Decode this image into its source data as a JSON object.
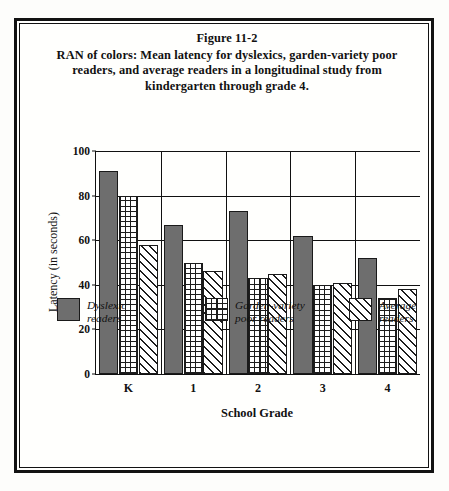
{
  "caption": {
    "figure_number": "Figure 11-2",
    "text": "RAN of colors: Mean latency for dyslexics, garden-variety poor readers, and average readers in a longitudinal study from kindergarten through grade 4."
  },
  "chart_data": {
    "type": "bar",
    "title": "RAN of colors: Mean latency for dyslexics, garden-variety poor readers, and average readers in a longitudinal study from kindergarten through grade 4.",
    "xlabel": "School Grade",
    "ylabel": "Latency (in seconds)",
    "categories": [
      "K",
      "1",
      "2",
      "3",
      "4"
    ],
    "ylim": [
      0,
      100
    ],
    "yticks": [
      0,
      20,
      40,
      60,
      80,
      100
    ],
    "grid": true,
    "legend_position": "bottom",
    "series": [
      {
        "name": "Dyslexic readers",
        "name_line1": "Dyslexic",
        "name_line2": "readers",
        "fill": "solid",
        "color": "#6e6e6e",
        "values": [
          91,
          67,
          73,
          62,
          52
        ]
      },
      {
        "name": "Garden-variety poor readers",
        "name_line1": "Garden-variety",
        "name_line2": "poor readers",
        "fill": "grid",
        "color": "#ffffff",
        "values": [
          80,
          50,
          43,
          40,
          34
        ]
      },
      {
        "name": "Average readers",
        "name_line1": "Average",
        "name_line2": "readers",
        "fill": "diag",
        "color": "#ffffff",
        "values": [
          58,
          46,
          45,
          41,
          38
        ]
      }
    ]
  }
}
